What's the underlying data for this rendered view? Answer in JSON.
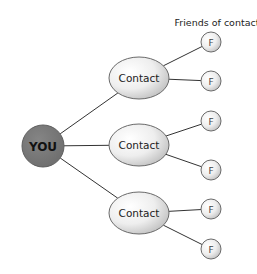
{
  "header_label": "Friends of contact",
  "you": {
    "label": "YOU",
    "fill": "#7a7a7a",
    "cx": 43,
    "cy": 146,
    "r": 21
  },
  "contacts": [
    {
      "label": "Contact",
      "cx": 139,
      "cy": 78,
      "rx": 30,
      "ry": 21
    },
    {
      "label": "Contact",
      "cx": 139,
      "cy": 145,
      "rx": 30,
      "ry": 21
    },
    {
      "label": "Contact",
      "cx": 139,
      "cy": 213,
      "rx": 30,
      "ry": 21
    }
  ],
  "friends": [
    {
      "label": "F",
      "cx": 211,
      "cy": 42,
      "r": 10,
      "contact": 0
    },
    {
      "label": "F",
      "cx": 211,
      "cy": 81,
      "r": 10,
      "contact": 0
    },
    {
      "label": "F",
      "cx": 211,
      "cy": 121,
      "r": 10,
      "contact": 1
    },
    {
      "label": "F",
      "cx": 211,
      "cy": 170,
      "r": 10,
      "contact": 1
    },
    {
      "label": "F",
      "cx": 211,
      "cy": 209,
      "r": 10,
      "contact": 2
    },
    {
      "label": "F",
      "cx": 211,
      "cy": 249,
      "r": 10,
      "contact": 2
    }
  ],
  "colors": {
    "line": "#333333",
    "node_stroke": "#6a6a6a",
    "node_fill_light": "#ffffff",
    "node_fill_dark": "#c8c8c8",
    "text": "#222222"
  }
}
